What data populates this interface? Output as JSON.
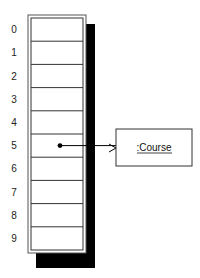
{
  "diagram": {
    "type": "array-reference",
    "array": {
      "indices": [
        "0",
        "1",
        "2",
        "3",
        "4",
        "5",
        "6",
        "7",
        "8",
        "9"
      ],
      "reference_index": 5
    },
    "object": {
      "label": ":Course"
    }
  }
}
